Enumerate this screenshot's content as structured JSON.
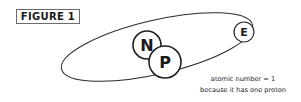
{
  "figure": {
    "label": "FIGURE 1"
  },
  "particles": [
    {
      "id": "neutron",
      "letter": "N"
    },
    {
      "id": "proton",
      "letter": "P"
    },
    {
      "id": "electron",
      "letter": "E"
    }
  ],
  "caption": {
    "line1": "atomic number = 1",
    "line2": "because it has one proton"
  },
  "colors": {
    "stroke": "#2a2a2a",
    "background": "#ffffff"
  }
}
